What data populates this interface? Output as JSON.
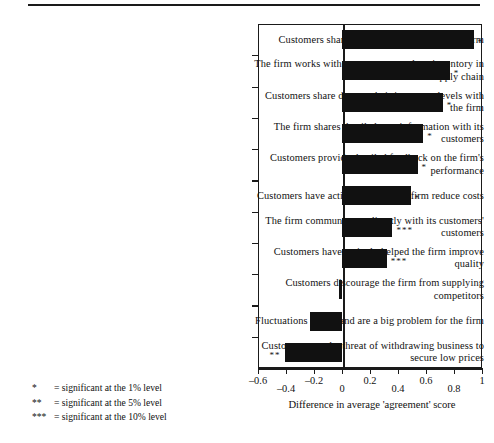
{
  "chart_data": {
    "type": "bar",
    "orientation": "horizontal",
    "title": "",
    "xlabel": "Difference in average 'agreement' score",
    "ylabel": "",
    "xlim": [
      -0.6,
      1.0
    ],
    "xticks": [
      -0.6,
      -0.4,
      -0.2,
      0,
      0.2,
      0.4,
      0.6,
      0.8,
      1
    ],
    "xticklabels": [
      "–0.6",
      "–0.4",
      "–0.2",
      "0",
      "0.2",
      "0.4",
      "0.6",
      "0.8",
      "1"
    ],
    "grid": false,
    "legend": "none",
    "bar_color": "#111111",
    "categories": [
      "Customers share demand forecasts with the firm",
      "The firm works with customers to reduce inventory in the supply chain",
      "Customers share data on their inventory levels with the firm",
      "The firm shares detailed cost information with its customers",
      "Customers provide detailed feedback on the firm's performance",
      "Customers have actively helped the firm reduce costs",
      "The firm communicates directly with its customers' customers",
      "Customers have actively helped the firm improve quality",
      "Customers discourage the firm from supplying competitors",
      "Fluctuations in demand are a big problem for the firm",
      "Customers use the threat of withdrawing business to secure low prices"
    ],
    "values": [
      0.94,
      0.77,
      0.72,
      0.58,
      0.54,
      0.49,
      0.36,
      0.32,
      -0.02,
      -0.23,
      -0.41
    ],
    "significance": [
      "*",
      "*",
      "*",
      "*",
      "*",
      "*",
      "***",
      "***",
      "",
      "",
      "**"
    ]
  },
  "notes": [
    {
      "stars": "*",
      "text": "= significant at the 1% level"
    },
    {
      "stars": "**",
      "text": "= significant at the 5% level"
    },
    {
      "stars": "***",
      "text": "= significant at the 10% level"
    }
  ]
}
